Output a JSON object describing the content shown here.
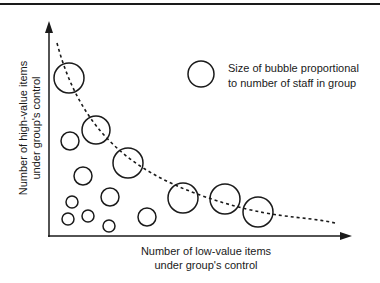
{
  "diagram": {
    "type": "bubble-scatter",
    "y_axis_label": {
      "line1": "Number of high-value items",
      "line2": "under group's control"
    },
    "x_axis_label": {
      "line1": "Number of low-value items",
      "line2": "under group's control"
    },
    "legend": {
      "line1": "Size of bubble proportional",
      "line2": "to number of staff in group"
    },
    "trend_line": {
      "style": "dashed",
      "description": "Inverse curve from high y / low x down to low y / high x"
    },
    "colors": {
      "stroke": "#1a1a1a",
      "background": "#ffffff",
      "text": "#1a1a1a"
    }
  },
  "chart_data": {
    "type": "scatter",
    "title": "",
    "xlabel": "Number of low-value items under group's control",
    "ylabel": "Number of high-value items under group's control",
    "legend": [
      "Size of bubble proportional to number of staff in group"
    ],
    "grid": false,
    "axis_ticks": false,
    "points": [
      {
        "x": 69,
        "y": 78,
        "r": 15
      },
      {
        "x": 96,
        "y": 130,
        "r": 14
      },
      {
        "x": 70,
        "y": 141,
        "r": 9
      },
      {
        "x": 128,
        "y": 163,
        "r": 15
      },
      {
        "x": 83,
        "y": 176,
        "r": 9
      },
      {
        "x": 72,
        "y": 202,
        "r": 6
      },
      {
        "x": 110,
        "y": 197,
        "r": 9
      },
      {
        "x": 68,
        "y": 219,
        "r": 6
      },
      {
        "x": 88,
        "y": 216,
        "r": 6
      },
      {
        "x": 109,
        "y": 226,
        "r": 6
      },
      {
        "x": 147,
        "y": 217,
        "r": 9
      },
      {
        "x": 183,
        "y": 198,
        "r": 15
      },
      {
        "x": 225,
        "y": 199,
        "r": 15
      },
      {
        "x": 258,
        "y": 212,
        "r": 15
      }
    ],
    "legend_bubble": {
      "x": 201,
      "y": 74,
      "r": 13
    },
    "trend_curve_path": "M57,43 C80,130 130,170 200,195 S300,215 335,223"
  }
}
